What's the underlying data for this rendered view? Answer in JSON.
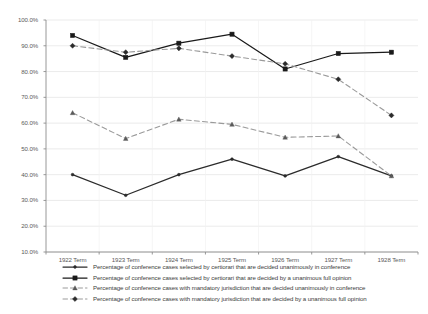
{
  "chart_data": {
    "type": "line",
    "title": "",
    "xlabel": "",
    "ylabel": "",
    "categories": [
      "1922 Term",
      "1923 Term",
      "1924 Term",
      "1925 Term",
      "1926 Term",
      "1927 Term",
      "1928 Term"
    ],
    "ylim": [
      10,
      100
    ],
    "ytick_labels": [
      "100.0%",
      "90.0%",
      "80.0%",
      "70.0%",
      "60.0%",
      "50.0%",
      "40.0%",
      "30.0%",
      "20.0%",
      "10.0%"
    ],
    "ytick_values": [
      100,
      90,
      80,
      70,
      60,
      50,
      40,
      30,
      20,
      10
    ],
    "grid": true,
    "legend_position": "bottom",
    "series": [
      {
        "name": "Percentage of conference cases selected by certiorari that are decided unanimously in conference",
        "key": "certiorari-unanimous-conference",
        "style": "solid",
        "marker": "dot",
        "color": "#2b2b2b",
        "values": [
          40.0,
          32.0,
          40.0,
          46.0,
          39.5,
          47.0,
          39.5
        ]
      },
      {
        "name": "Percentage of conference cases selected by certiorari that are decided by a unanimous full opinion",
        "key": "certiorari-unanimous-full-opinion",
        "style": "solid",
        "marker": "square",
        "color": "#1a1a1a",
        "values": [
          94.0,
          85.5,
          91.0,
          94.5,
          81.0,
          87.0,
          87.5
        ]
      },
      {
        "name": "Percentage of conference cases with mandatory jurisdiction that are decided unanimously in conference",
        "key": "mandatory-unanimous-conference",
        "style": "dashed",
        "marker": "triangle",
        "color": "#9a9a9a",
        "values": [
          64.0,
          54.0,
          61.5,
          59.5,
          54.5,
          55.0,
          39.5
        ]
      },
      {
        "name": "Percentage of conference cases with mandatory jurisdiction that are decided by a unanimous full opinion",
        "key": "mandatory-unanimous-full-opinion",
        "style": "dashed",
        "marker": "diamond",
        "color": "#9a9a9a",
        "values": [
          90.0,
          87.5,
          89.0,
          86.0,
          83.0,
          77.0,
          63.0
        ]
      }
    ]
  },
  "colors": {
    "grid": "#e2e2e2",
    "axis": "#8d8d8d",
    "tick_text": "#5a5a5a",
    "legend_text": "#3c3c3c",
    "background": "#ffffff"
  }
}
